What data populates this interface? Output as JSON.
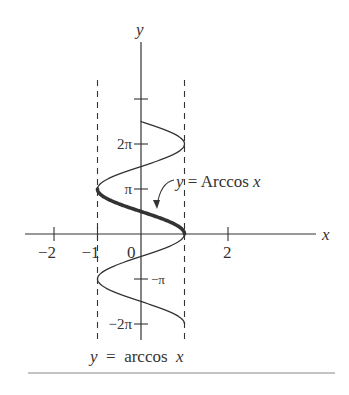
{
  "chart_data": {
    "type": "line",
    "title": "",
    "xlabel": "x",
    "ylabel": "y",
    "xlim": [
      -2.6,
      4.0
    ],
    "ylim": [
      -2.3,
      4.3
    ],
    "y_unit": "pi",
    "x_ticks": [
      {
        "value": -2,
        "label": "−2"
      },
      {
        "value": -1,
        "label": "−1"
      },
      {
        "value": 0,
        "label": "0"
      },
      {
        "value": 2,
        "label": "2"
      }
    ],
    "y_ticks": [
      {
        "value_pi": 3,
        "label": ""
      },
      {
        "value_pi": 2,
        "label": "2π"
      },
      {
        "value_pi": 1,
        "label": "π"
      },
      {
        "value_pi": -1,
        "label": "−π"
      },
      {
        "value_pi": -2,
        "label": "−2π"
      }
    ],
    "asymptotes": [
      {
        "x": -1,
        "style": "dashed"
      },
      {
        "x": 1,
        "style": "dashed"
      }
    ],
    "series": [
      {
        "name": "y = arccos x (relation x = cos y)",
        "relation": "x = cos(y)",
        "y_range_pi": [
          -2,
          2.5
        ],
        "style": "thin"
      },
      {
        "name": "y = Arccos x (principal branch)",
        "relation": "x = cos(y)",
        "y_range_pi": [
          0,
          1
        ],
        "style": "thick"
      }
    ],
    "annotations": [
      {
        "text_parts": [
          "y",
          " = Arccos ",
          "x"
        ],
        "points_to": {
          "x": 0.35,
          "y_pi": 0.39
        }
      }
    ],
    "caption": {
      "parts": [
        "y",
        "  =  arccos  ",
        "x"
      ]
    }
  },
  "labels": {
    "x_axis": "x",
    "y_axis": "y",
    "annotation_y": "y",
    "annotation_mid": " = Arccos ",
    "annotation_x": "x",
    "caption_y": "y",
    "caption_mid": "  =  arccos  ",
    "caption_x": "x"
  },
  "colors": {
    "ink": "#333333",
    "rule": "#888888",
    "background": "#ffffff"
  }
}
